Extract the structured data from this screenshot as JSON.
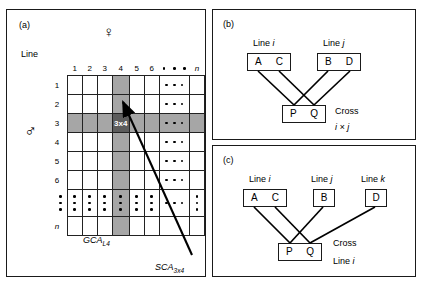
{
  "figure": {
    "type": "diagram"
  },
  "panel_a": {
    "label": "(a)",
    "line_axis_label": "Line",
    "female_symbol": "♀",
    "male_symbol": "♂",
    "female_symbol_name": "female-venus-symbol",
    "male_symbol_name": "male-mars-symbol",
    "column_headers": [
      "1",
      "2",
      "3",
      "4",
      "5",
      "6",
      "• • •",
      "n"
    ],
    "row_headers": [
      "1",
      "2",
      "3",
      "4",
      "5",
      "6",
      "•",
      "n"
    ],
    "highlight_cell_label": "3x4",
    "highlight_row_index": 3,
    "highlight_col_index": 4,
    "gray_color": "#a6a6a6",
    "dark_color": "#5c5c5c",
    "annotations": {
      "gca_row": "GCA",
      "gca_row_sub": "L3",
      "gca_col": "GCA",
      "gca_col_sub": "L4",
      "sca": "SCA",
      "sca_sub": "3x4"
    }
  },
  "panel_b": {
    "label": "(b)",
    "parent_lines": [
      {
        "title": "Line",
        "title_italic": "i",
        "alleles": [
          "A",
          "C"
        ]
      },
      {
        "title": "Line",
        "title_italic": "j",
        "alleles": [
          "B",
          "D"
        ]
      }
    ],
    "progeny": {
      "alleles": [
        "P",
        "Q"
      ]
    },
    "cross_label": "Cross",
    "cross_detail": "i × j"
  },
  "panel_c": {
    "label": "(c)",
    "parent_lines": [
      {
        "title": "Line",
        "title_italic": "i",
        "alleles": [
          "A",
          "C"
        ]
      },
      {
        "title": "Line",
        "title_italic": "j",
        "alleles": [
          "B"
        ]
      },
      {
        "title": "Line",
        "title_italic": "k",
        "alleles": [
          "D"
        ]
      }
    ],
    "progeny": {
      "alleles": [
        "P",
        "Q"
      ]
    },
    "cross_label": "Cross",
    "cross_detail_prefix": "Line",
    "cross_detail_italic": "i"
  }
}
